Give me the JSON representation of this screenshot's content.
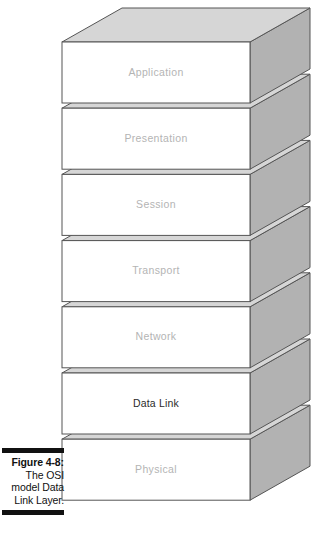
{
  "figure": {
    "caption_label": "Figure 4-8:",
    "caption_lines": [
      "The OSI",
      "model Data",
      "Link Layer."
    ],
    "caption_full": "Figure 4-8: The OSI model Data Link Layer."
  },
  "diagram": {
    "type": "osi-layer-stack",
    "title": "The OSI model Data Link Layer",
    "orientation": "isometric-3d-stack",
    "layer_count": 7,
    "highlighted_layer": "Data Link",
    "layers": [
      {
        "index": 7,
        "name": "Application",
        "highlighted": false,
        "text_color": "#b4b4b4"
      },
      {
        "index": 6,
        "name": "Presentation",
        "highlighted": false,
        "text_color": "#b4b4b4"
      },
      {
        "index": 5,
        "name": "Session",
        "highlighted": false,
        "text_color": "#b4b4b4"
      },
      {
        "index": 4,
        "name": "Transport",
        "highlighted": false,
        "text_color": "#b4b4b4"
      },
      {
        "index": 3,
        "name": "Network",
        "highlighted": false,
        "text_color": "#b4b4b4"
      },
      {
        "index": 2,
        "name": "Data Link",
        "highlighted": true,
        "text_color": "#2b2b2b"
      },
      {
        "index": 1,
        "name": "Physical",
        "highlighted": false,
        "text_color": "#b4b4b4"
      }
    ]
  },
  "colors": {
    "page_background": "#ffffff",
    "slab_front_face": "#ffffff",
    "slab_top_face": "#d6d6d6",
    "slab_side_face": "#b2b2b2",
    "slab_outline": "#555555",
    "caption_rule": "#111111",
    "caption_text": "#111111",
    "label_muted": "#b4b4b4",
    "label_highlight": "#2b2b2b"
  }
}
